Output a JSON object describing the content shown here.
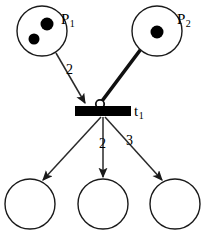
{
  "figure": {
    "background_color": "#ffffff",
    "stroke_color": "#1a1a1a",
    "fill_color": "#000000"
  },
  "places": [
    {
      "id": "p1",
      "label": "P",
      "subscript": "1",
      "cx": 42,
      "cy": 31,
      "r": 25,
      "tokens": 2,
      "token_positions": [
        {
          "cx": 47,
          "cy": 24,
          "r": 6.5
        },
        {
          "cx": 34,
          "cy": 39,
          "r": 5.5
        }
      ]
    },
    {
      "id": "p2",
      "label": "P",
      "subscript": "2",
      "cx": 157,
      "cy": 31,
      "r": 25,
      "tokens": 1,
      "token_positions": [
        {
          "cx": 157,
          "cy": 32,
          "r": 6.5
        }
      ]
    },
    {
      "id": "p3",
      "label": "",
      "subscript": "",
      "cx": 30,
      "cy": 204,
      "r": 25,
      "tokens": 0,
      "token_positions": []
    },
    {
      "id": "p4",
      "label": "",
      "subscript": "",
      "cx": 103,
      "cy": 204,
      "r": 25,
      "tokens": 0,
      "token_positions": []
    },
    {
      "id": "p5",
      "label": "",
      "subscript": "",
      "cx": 175,
      "cy": 204,
      "r": 25,
      "tokens": 0,
      "token_positions": []
    }
  ],
  "transition": {
    "id": "t1",
    "label": "t",
    "subscript": "1",
    "x": 75,
    "y": 106,
    "width": 56,
    "height": 10
  },
  "arcs": [
    {
      "id": "arc-p1-t1",
      "from": "p1",
      "to": "t1",
      "type": "normal",
      "weight": "2",
      "weight_x": 66,
      "weight_y": 63
    },
    {
      "id": "arc-p2-t1",
      "from": "p2",
      "to": "t1",
      "type": "inhibitor",
      "weight": "",
      "weight_x": null,
      "weight_y": null
    },
    {
      "id": "arc-t1-p3",
      "from": "t1",
      "to": "p3",
      "type": "normal",
      "weight": "",
      "weight_x": null,
      "weight_y": null
    },
    {
      "id": "arc-t1-p4",
      "from": "t1",
      "to": "p4",
      "type": "normal",
      "weight": "2",
      "weight_x": 99,
      "weight_y": 137
    },
    {
      "id": "arc-t1-p5",
      "from": "t1",
      "to": "p5",
      "type": "normal",
      "weight": "3",
      "weight_x": 126,
      "weight_y": 134
    }
  ]
}
